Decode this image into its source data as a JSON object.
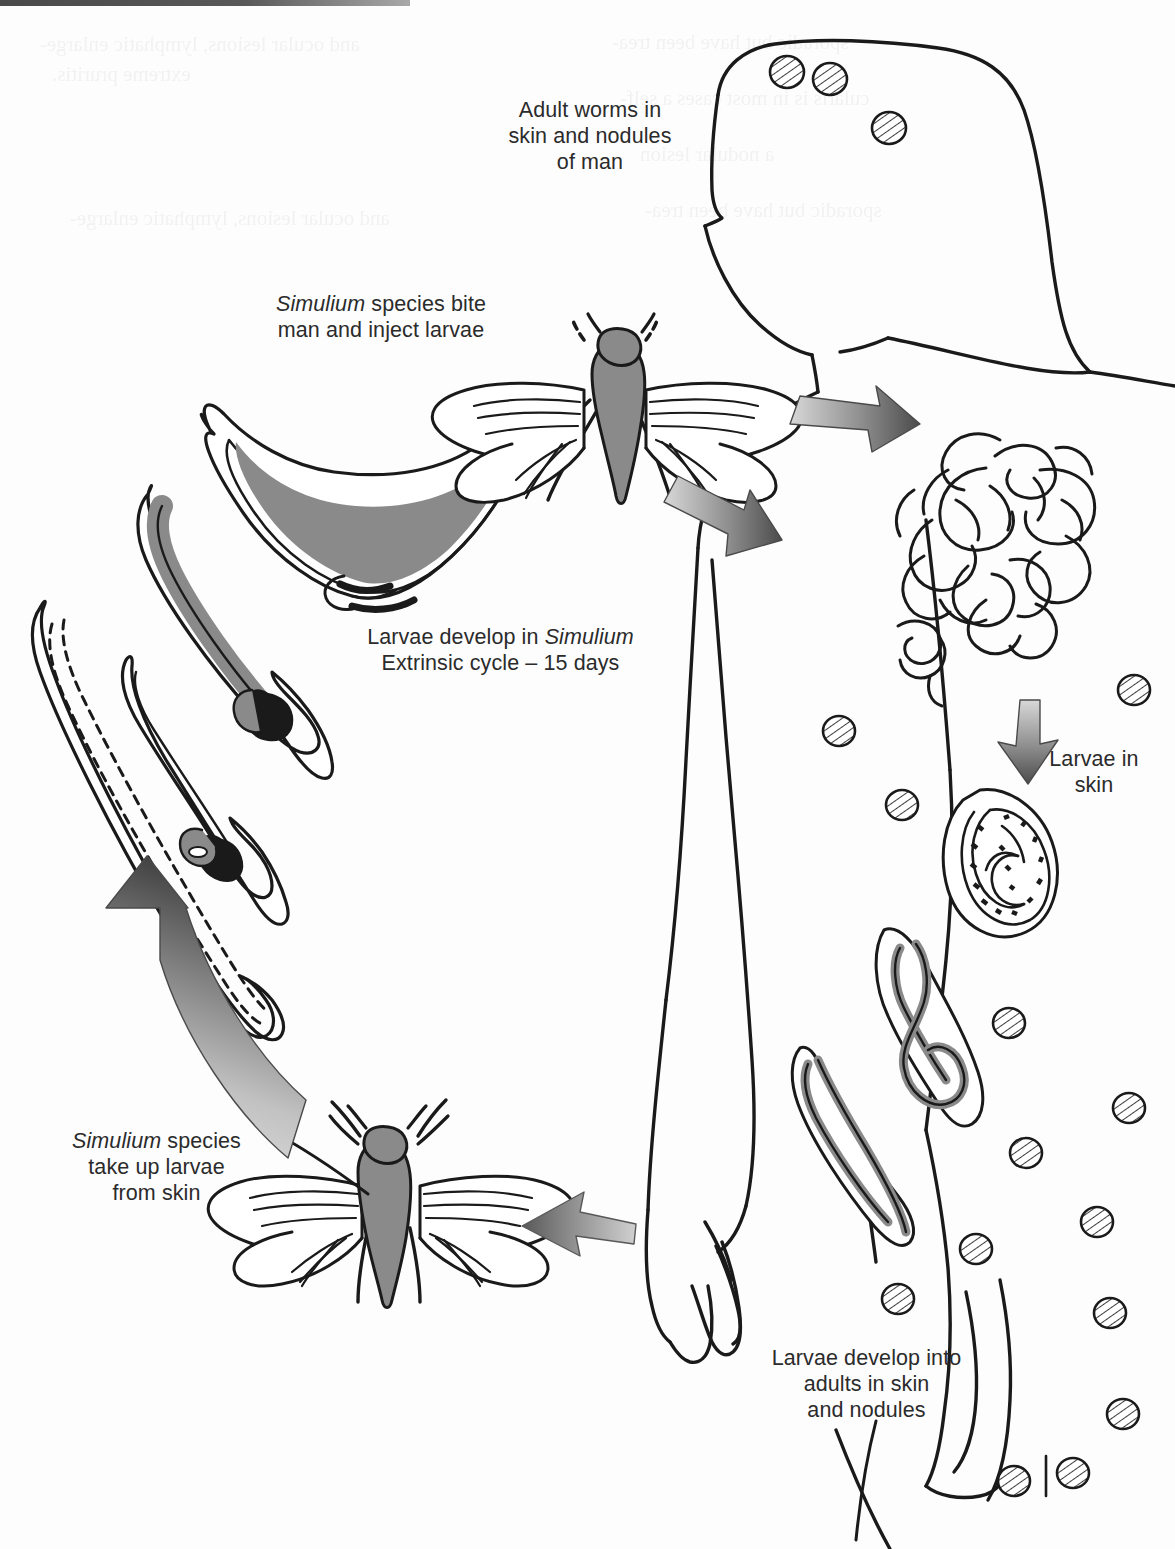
{
  "diagram": {
    "type": "life-cycle-diagram",
    "background_color": "#ffffff",
    "ink_color": "#1a1a1a",
    "fill_gray": "#8a8a8a",
    "arrow_dark": "#4a4a4a",
    "arrow_light": "#d4d4d4"
  },
  "labels": {
    "adult_worms": {
      "lines": [
        "Adult worms in",
        "skin and nodules",
        "of man"
      ]
    },
    "simulium_bite": {
      "line1_italic": "Simulium",
      "line1_rest": " species bite",
      "line2": "man and inject larvae"
    },
    "larvae_develop": {
      "line1_pre": "Larvae develop in ",
      "line1_italic": "Simulium",
      "line2": "Extrinsic cycle – 15 days"
    },
    "simulium_takeup": {
      "line1_italic": "Simulium",
      "line1_rest": " species",
      "line2": "take up larvae",
      "line3": "from skin"
    },
    "larvae_in_skin": {
      "lines": [
        "Larvae in",
        "skin"
      ]
    },
    "larvae_to_adults": {
      "lines": [
        "Larvae develop into",
        "adults in skin",
        "and nodules"
      ]
    }
  },
  "ghost_text": {
    "note": "faint show-through text from reverse of page, illegible",
    "lines": [
      "and ocular lesions, lymphatic enlarge-",
      "extreme pruritis.",
      "sporadic but have been trea-",
      "cularis is in most cases a self-",
      "a nodular lesion"
    ]
  },
  "elements": {
    "human_figure": {
      "name": "human-body-outline",
      "nodule_count": 17
    },
    "flies": [
      {
        "name": "simulium-fly-upper",
        "body_color": "#8a8a8a"
      },
      {
        "name": "simulium-fly-lower",
        "body_color": "#8a8a8a"
      }
    ],
    "arrows": [
      {
        "name": "arrow-fly-to-head",
        "direction": "right-down"
      },
      {
        "name": "arrow-fly-to-body",
        "direction": "right-down"
      },
      {
        "name": "arrow-worms-to-skin",
        "direction": "down"
      },
      {
        "name": "arrow-skin-to-fly",
        "direction": "left"
      },
      {
        "name": "arrow-fly-to-larvae",
        "direction": "up-curved"
      }
    ],
    "larval_stages": [
      {
        "name": "microfilaria-dashed",
        "stage": "microfilaria ingested"
      },
      {
        "name": "sausage-stage-larva-1",
        "stage": "first stage larva"
      },
      {
        "name": "sausage-stage-larva-2",
        "stage": "second stage larva"
      },
      {
        "name": "infective-larva-l3",
        "stage": "infective third stage larva"
      }
    ],
    "worm_mass": {
      "name": "adult-worm-tangle"
    },
    "coiled_microfilaria": {
      "name": "coiled-microfilaria-in-skin"
    },
    "adult_worms_in_skin": [
      {
        "name": "adult-worm-figure-eight"
      },
      {
        "name": "adult-worm-hooked"
      }
    ]
  }
}
